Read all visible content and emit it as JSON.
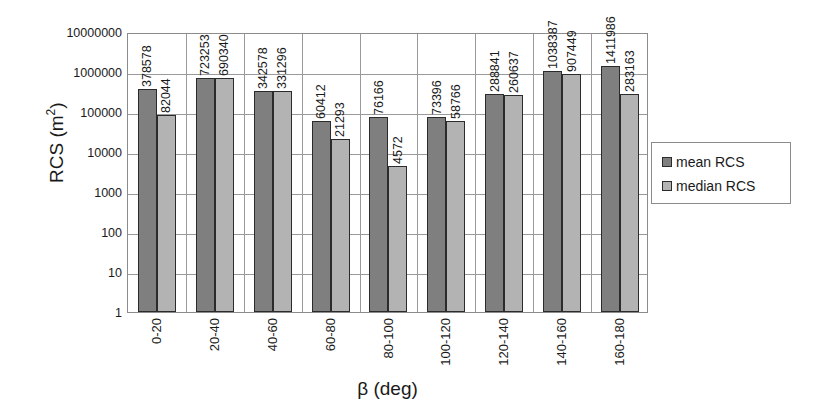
{
  "chart_data": {
    "type": "bar",
    "title": "",
    "subtitle": "",
    "xlabel": "β (deg)",
    "ylabel": "RCS (m²)",
    "ylabel_base": "RCS (m",
    "ylabel_sup": "2",
    "ylabel_tail": ")",
    "yscale": "log",
    "ylim": [
      1,
      10000000
    ],
    "grid": "both",
    "legend_position": "right",
    "categories": [
      "0-20",
      "20-40",
      "40-60",
      "60-80",
      "80-100",
      "100-120",
      "120-140",
      "140-160",
      "160-180"
    ],
    "ytick_labels": [
      "10000000",
      "1000000",
      "100000",
      "10000",
      "1000",
      "100",
      "10",
      "1"
    ],
    "ytick_values": [
      10000000,
      1000000,
      100000,
      10000,
      1000,
      100,
      10,
      1
    ],
    "series": [
      {
        "name": "mean RCS",
        "color": "#7f7f7f",
        "values": [
          378578,
          723253,
          342578,
          60412,
          76166,
          73396,
          288841,
          1038387,
          1411986
        ],
        "labels": [
          "378578",
          "723253",
          "342578",
          "60412",
          "76166",
          "73396",
          "288841",
          "1038387",
          "1411986"
        ]
      },
      {
        "name": "median RCS",
        "color": "#b3b3b3",
        "values": [
          82044,
          690340,
          331296,
          21293,
          4572,
          58766,
          260637,
          907449,
          283163
        ],
        "labels": [
          "82044",
          "690340",
          "331296",
          "21293",
          "4572",
          "58766",
          "260637",
          "907449",
          "283163"
        ]
      }
    ]
  },
  "legend": {
    "items": [
      {
        "label": "mean RCS",
        "color": "#7f7f7f"
      },
      {
        "label": "median RCS",
        "color": "#b3b3b3"
      }
    ]
  },
  "colors": {
    "mean": "#7f7f7f",
    "median": "#b3b3b3",
    "grid": "#9a9a9a",
    "axis": "#8c8c8c",
    "bar_outline": "#2b2b2b",
    "text": "#1a1a1a",
    "background": "#ffffff"
  }
}
